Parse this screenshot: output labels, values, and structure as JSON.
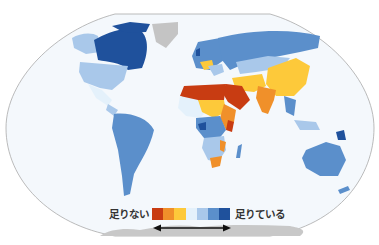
{
  "map": {
    "title": "",
    "ocean_color": "#f4f8fc",
    "frame_color": "#a9a9a9",
    "no_data_color": "#c4c4c4",
    "antarctica_color": "#c8c8c8",
    "regions": [
      {
        "name": "Canada",
        "class": 7
      },
      {
        "name": "Alaska/USA",
        "class": 5
      },
      {
        "name": "Greenland",
        "class": "no-data"
      },
      {
        "name": "Central America",
        "class": 4
      },
      {
        "name": "South America",
        "class": 6
      },
      {
        "name": "Europe West",
        "class": 6
      },
      {
        "name": "Russia",
        "class": 6
      },
      {
        "name": "Central Asia",
        "class": 5
      },
      {
        "name": "China",
        "class": 3
      },
      {
        "name": "India",
        "class": 2
      },
      {
        "name": "Middle East / Arabia",
        "class": 1
      },
      {
        "name": "North Africa",
        "class": 1
      },
      {
        "name": "Sahel / West Africa",
        "class": 3
      },
      {
        "name": "East Africa",
        "class": 2
      },
      {
        "name": "Central Africa",
        "class": 6
      },
      {
        "name": "Southern Africa",
        "class": 5
      },
      {
        "name": "Madagascar",
        "class": 6
      },
      {
        "name": "Southeast Asia",
        "class": 5
      },
      {
        "name": "Papua New Guinea",
        "class": 7
      },
      {
        "name": "Australia",
        "class": 6
      },
      {
        "name": "Antarctica",
        "class": "no-data"
      }
    ]
  },
  "legend": {
    "low_label": "足りない",
    "high_label": "足りている",
    "colors": [
      "#c83c12",
      "#f0902a",
      "#fdc93a",
      "#e4f1fb",
      "#a9c8ea",
      "#5b8fcb",
      "#1f519c"
    ],
    "arrow": "double-headed"
  }
}
